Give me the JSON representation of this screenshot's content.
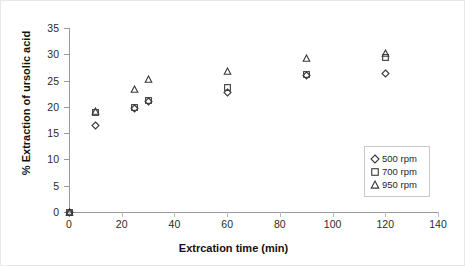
{
  "chart_data": {
    "type": "scatter",
    "title": "",
    "xlabel": "Extrcation time (min)",
    "ylabel": "% Extraction of ursolic acid",
    "xlim": [
      0,
      140
    ],
    "ylim": [
      0,
      35
    ],
    "xticks": [
      0,
      20,
      40,
      60,
      80,
      100,
      120,
      140
    ],
    "yticks": [
      0,
      5,
      10,
      15,
      20,
      25,
      30,
      35
    ],
    "grid": false,
    "legend_position": "inside-right",
    "series": [
      {
        "name": "500 rpm",
        "marker": "diamond",
        "color": "#3a3a3a",
        "x": [
          0,
          10,
          25,
          30,
          60,
          90,
          120
        ],
        "y": [
          0,
          16.5,
          19.7,
          21.0,
          22.8,
          26.0,
          26.3
        ]
      },
      {
        "name": "700 rpm",
        "marker": "square",
        "color": "#3a3a3a",
        "x": [
          0,
          10,
          25,
          30,
          60,
          90,
          120
        ],
        "y": [
          0,
          19.0,
          19.8,
          21.3,
          23.7,
          26.1,
          29.3
        ]
      },
      {
        "name": "950 rpm",
        "marker": "triangle",
        "color": "#3a3a3a",
        "x": [
          0,
          10,
          25,
          30,
          60,
          90,
          120
        ],
        "y": [
          0,
          19.1,
          23.3,
          25.2,
          26.8,
          29.2,
          30.2
        ]
      }
    ]
  },
  "legend": {
    "items": [
      {
        "label": "500 rpm",
        "marker": "diamond"
      },
      {
        "label": "700 rpm",
        "marker": "square"
      },
      {
        "label": "950 rpm",
        "marker": "triangle"
      }
    ]
  }
}
